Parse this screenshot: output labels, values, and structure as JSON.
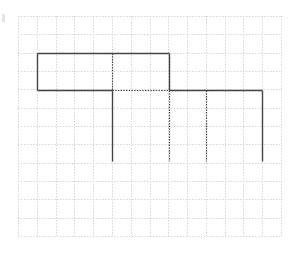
{
  "diagram": {
    "type": "grid-drawing",
    "grid": {
      "x0": 18,
      "y0": 16,
      "x1": 281,
      "y1": 236,
      "cols": 14,
      "rows": 12,
      "line_color": "#d6d6d6"
    },
    "stroke_color": "#444444",
    "segments": [
      {
        "x1": 37,
        "y1": 53,
        "x2": 112,
        "y2": 53,
        "style": "solid"
      },
      {
        "x1": 112,
        "y1": 53,
        "x2": 169,
        "y2": 53,
        "style": "solid"
      },
      {
        "x1": 37,
        "y1": 53,
        "x2": 37,
        "y2": 90,
        "style": "solid"
      },
      {
        "x1": 37,
        "y1": 90,
        "x2": 112,
        "y2": 90,
        "style": "solid"
      },
      {
        "x1": 169,
        "y1": 53,
        "x2": 169,
        "y2": 90,
        "style": "solid"
      },
      {
        "x1": 112,
        "y1": 53,
        "x2": 112,
        "y2": 90,
        "style": "dotted"
      },
      {
        "x1": 112,
        "y1": 90,
        "x2": 169,
        "y2": 90,
        "style": "dotted"
      },
      {
        "x1": 169,
        "y1": 90,
        "x2": 262,
        "y2": 90,
        "style": "solid"
      },
      {
        "x1": 112,
        "y1": 90,
        "x2": 112,
        "y2": 161,
        "style": "solid"
      },
      {
        "x1": 262,
        "y1": 90,
        "x2": 262,
        "y2": 161,
        "style": "solid"
      },
      {
        "x1": 169,
        "y1": 90,
        "x2": 169,
        "y2": 161,
        "style": "dotted"
      },
      {
        "x1": 206,
        "y1": 90,
        "x2": 206,
        "y2": 161,
        "style": "dotted"
      }
    ]
  }
}
